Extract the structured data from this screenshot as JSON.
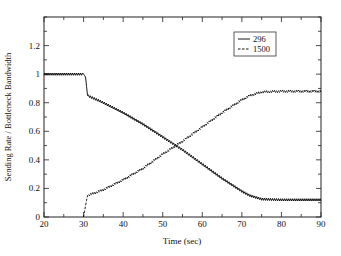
{
  "chart_data": {
    "type": "line",
    "title": "",
    "xlabel": "Time (sec)",
    "ylabel": "Sending Rate / Bottleneck Bandwidth",
    "xlim": [
      20,
      90
    ],
    "ylim": [
      0,
      1.4
    ],
    "xticks": [
      20,
      30,
      40,
      50,
      60,
      70,
      80,
      90
    ],
    "xtick_labels": [
      "20",
      "30",
      "40",
      "50",
      "60",
      "70",
      "80",
      "90"
    ],
    "xminor_step": 5,
    "yticks": [
      0,
      0.2,
      0.4,
      0.6,
      0.8,
      1,
      1.2
    ],
    "ytick_labels": [
      "0",
      "0.2",
      "0.4",
      "0.6",
      "0.8",
      "1",
      "1.2"
    ],
    "yminor_step": 0.1,
    "grid": false,
    "legend_position": "upper right (inside)",
    "series": [
      {
        "name": "296",
        "style": "solid",
        "color": "#000000",
        "x": [
          20,
          25,
          30,
          30.5,
          31,
          35,
          40,
          45,
          50,
          55,
          60,
          65,
          70,
          72,
          75,
          80,
          85,
          90
        ],
        "y": [
          1.0,
          1.0,
          1.0,
          0.98,
          0.85,
          0.8,
          0.73,
          0.65,
          0.56,
          0.47,
          0.37,
          0.27,
          0.18,
          0.15,
          0.125,
          0.12,
          0.12,
          0.12
        ]
      },
      {
        "name": "1500",
        "style": "dashed",
        "color": "#000000",
        "x": [
          30,
          30.5,
          31,
          35,
          40,
          45,
          50,
          55,
          60,
          65,
          70,
          72,
          75,
          80,
          85,
          90
        ],
        "y": [
          0.0,
          0.08,
          0.15,
          0.19,
          0.26,
          0.34,
          0.44,
          0.53,
          0.63,
          0.73,
          0.82,
          0.85,
          0.875,
          0.88,
          0.88,
          0.88
        ]
      }
    ],
    "annotations": [
      "Curves show small sawtooth oscillations (~±0.01) around the trend"
    ]
  }
}
